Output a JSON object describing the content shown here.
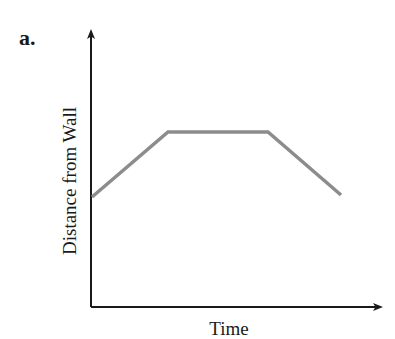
{
  "panel_label": "a.",
  "colors": {
    "axis": "#1a1a1a",
    "line": "#8c8c8c",
    "background": "#ffffff"
  },
  "chart_data": {
    "type": "line",
    "title": "",
    "xlabel": "Time",
    "ylabel": "Distance from Wall",
    "grid": false,
    "legend": null,
    "axis_ticks": "none (qualitative axes with arrowheads)",
    "xlim": [
      0,
      1
    ],
    "ylim": [
      0,
      1
    ],
    "series": [
      {
        "name": "distance",
        "x": [
          0.0,
          0.27,
          0.61,
          0.86
        ],
        "y": [
          0.4,
          0.63,
          0.63,
          0.4
        ],
        "description": "Starts at moderate distance, increases linearly, stays constant, then decreases linearly"
      }
    ],
    "pixel_points": [
      [
        92,
        197
      ],
      [
        168,
        132
      ],
      [
        268,
        132
      ],
      [
        341,
        195
      ]
    ]
  }
}
